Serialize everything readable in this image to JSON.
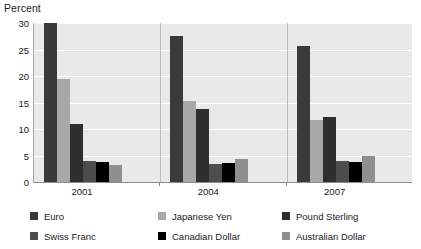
{
  "chart_data": {
    "type": "bar",
    "title": "",
    "subtitle": "",
    "xlabel": "",
    "ylabel": "Percent",
    "ylim": [
      0,
      30
    ],
    "yticks": [
      0,
      5,
      10,
      15,
      20,
      25,
      30
    ],
    "ytick_labels": [
      "0",
      "5",
      "10",
      "15",
      "20",
      "25",
      "30"
    ],
    "grid": true,
    "grid_orientation": "horizontal",
    "legend_position": "bottom",
    "legend_columns": 3,
    "categories": [
      "2001",
      "2004",
      "2007"
    ],
    "series": [
      {
        "name": "Euro",
        "color": "#3a3a3a",
        "values": [
          30.0,
          27.5,
          25.7
        ]
      },
      {
        "name": "Japanese Yen",
        "color": "#a8a8a8",
        "values": [
          19.5,
          15.3,
          11.7
        ]
      },
      {
        "name": "Pound Sterling",
        "color": "#2e2e2e",
        "values": [
          10.9,
          13.7,
          12.3
        ]
      },
      {
        "name": "Swiss Franc",
        "color": "#4d4d4d",
        "values": [
          4.0,
          3.4,
          3.9
        ]
      },
      {
        "name": "Canadian Dollar",
        "color": "#000000",
        "values": [
          3.8,
          3.5,
          3.8
        ]
      },
      {
        "name": "Australian Dollar",
        "color": "#8f8f8f",
        "values": [
          3.3,
          4.3,
          5.0
        ]
      }
    ],
    "annotations": []
  },
  "axis": {
    "y_title": "Percent"
  },
  "colors": {
    "plot_background": "#e9e9e9",
    "page_background": "#ffffff",
    "gridline": "#ffffff",
    "axis_line": "#8c8c8c",
    "text": "#1a1a1a"
  }
}
